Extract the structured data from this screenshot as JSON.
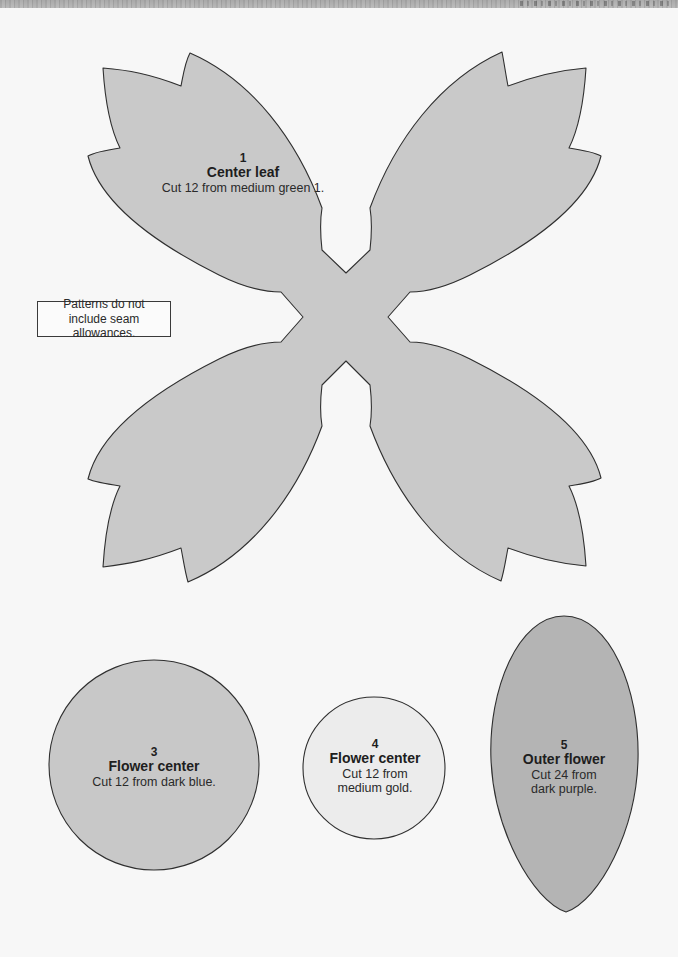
{
  "page": {
    "background": "#f7f7f7",
    "note": {
      "line1": "Patterns do not",
      "line2": "include seam allowances."
    }
  },
  "patterns": [
    {
      "number": "1",
      "name": "Center leaf",
      "instruction": "Cut 12 from medium green 1.",
      "shape": "four-leaf-x",
      "fill": "#c9c9c9"
    },
    {
      "number": "3",
      "name": "Flower center",
      "instruction": "Cut 12 from dark blue.",
      "shape": "circle-large",
      "fill": "#c8c8c8"
    },
    {
      "number": "4",
      "name": "Flower center",
      "instruction_line1": "Cut 12 from",
      "instruction_line2": "medium gold.",
      "shape": "circle-small",
      "fill": "#ececec"
    },
    {
      "number": "5",
      "name": "Outer flower",
      "instruction_line1": "Cut 24 from",
      "instruction_line2": "dark purple.",
      "shape": "oval-petal",
      "fill": "#b4b4b4"
    }
  ],
  "colors": {
    "outline": "#2f2f2f",
    "leaf_fill": "#c9c9c9",
    "circle3_fill": "#c8c8c8",
    "circle4_fill": "#ececec",
    "petal5_fill": "#b4b4b4"
  }
}
